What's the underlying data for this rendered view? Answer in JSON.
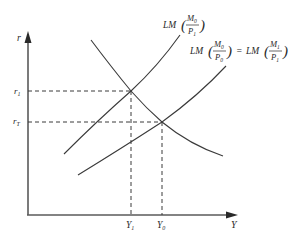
{
  "diagram": {
    "type": "IS-LM diagram",
    "axes": {
      "y_label": "r",
      "x_label": "Y"
    },
    "y_ticks": [
      {
        "main": "r",
        "sub": "1",
        "id": "r1"
      },
      {
        "main": "r",
        "sub": "T",
        "id": "rT"
      }
    ],
    "x_ticks": [
      {
        "main": "Y",
        "sub": "1",
        "id": "Y1"
      },
      {
        "main": "Y",
        "sub": "0",
        "id": "Y0"
      }
    ],
    "curves": {
      "is": {
        "name": "IS"
      },
      "lm_upper": {
        "prefix": "LM",
        "num_main": "M",
        "num_sub": "0",
        "den_main": "P",
        "den_sub": "1"
      },
      "lm_lower": {
        "prefix": "LM",
        "num_main": "M",
        "num_sub": "0",
        "den_main": "P",
        "den_sub": "0",
        "equals": "=",
        "prefix2": "LM",
        "num2_main": "M",
        "num2_sub": "1",
        "den2_main": "P",
        "den2_sub": "1"
      }
    },
    "equilibria": [
      {
        "r": "r1",
        "Y": "Y1",
        "curve": "LM(M0/P1)"
      },
      {
        "r": "rT",
        "Y": "Y0",
        "curve": "LM(M0/P0) = LM(M1/P1)"
      }
    ],
    "colors": {
      "line": "#3a3a3a",
      "axis": "#5a5a5a",
      "text": "#2a2a2a",
      "background": "#ffffff"
    }
  }
}
